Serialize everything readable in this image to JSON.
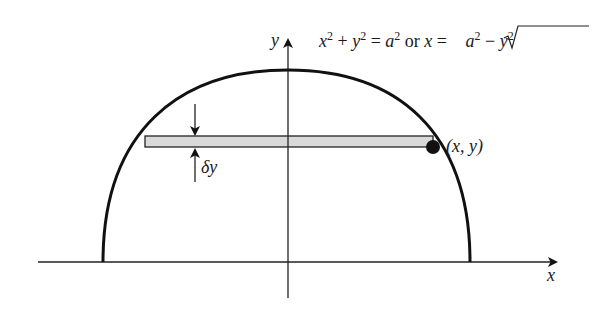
{
  "figure": {
    "equation": {
      "part1": "x",
      "sup1": "2",
      "plus": " + ",
      "part2": "y",
      "sup2": "2",
      "eq": " = ",
      "part3": "a",
      "sup3": "2",
      "or": " or ",
      "part4": "x",
      "eq2": " = ",
      "sqrt_a": "a",
      "sqrt_sup_a": "2",
      "minus": " − ",
      "sqrt_y": "y",
      "sqrt_sup_y": "2"
    },
    "axis_labels": {
      "x": "x",
      "y": "y"
    },
    "point_label": "(x, y)",
    "strip_label": "δy",
    "colors": {
      "stroke": "#111111",
      "strip_fill": "#d9d9d9",
      "background": "#ffffff"
    }
  }
}
